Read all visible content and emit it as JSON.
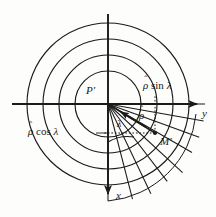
{
  "figure": {
    "type": "polar-coordinate-diagram",
    "background_color": "#fdfdfb",
    "ink_color": "#1a1a1a",
    "origin": {
      "x": 108,
      "y": 104,
      "label": "P'"
    },
    "point_m": {
      "x": 155,
      "y": 133,
      "label": "M'"
    }
  },
  "axes": {
    "y_axis": {
      "label": "y",
      "direction": "right",
      "arrow": true,
      "start_x": 12,
      "end_x": 200,
      "y": 104,
      "label_x": 201,
      "label_y": 113
    },
    "x_axis": {
      "label": "x",
      "direction": "down",
      "arrow": true,
      "x": 108,
      "start_y": 14,
      "end_y": 197,
      "label_x": 115,
      "label_y": 196
    }
  },
  "labels": {
    "origin": {
      "text": "P'",
      "x": 86,
      "y": 91
    },
    "point_m": {
      "text": "M'",
      "x": 160,
      "y": 142
    },
    "rho_sin_lambda": {
      "var": "ρ",
      "hat": "ˆ",
      "rest": " sin ",
      "angle": "λ",
      "x": 143,
      "y": 86
    },
    "rho_cos_lambda": {
      "var": "ρ",
      "hat": "ˆ",
      "rest": " cos ",
      "angle": "λ",
      "x": 55,
      "y": 128
    },
    "rho": {
      "var": "ρ",
      "hat": "ˆ",
      "x": 140,
      "y": 113
    },
    "lambda": {
      "text": "λ",
      "x": 117,
      "y": 123
    }
  },
  "grid": {
    "circle_count": 4,
    "circle_radii": [
      33,
      49,
      65,
      81
    ],
    "radial_line_count": 9,
    "radial_angle_start_deg": 0,
    "radial_angle_end_deg": 90,
    "quadrant_with_grid": "lower-right",
    "dotted_guides": [
      {
        "from": "M'",
        "to": "y-axis vertical drop"
      },
      {
        "from": "M'",
        "to": "x-axis horizontal"
      }
    ]
  },
  "vector": {
    "from": "P'",
    "to": "M'",
    "arrow_head": true,
    "angle_arc_radius": 22,
    "note": "arrow from origin toward M' drawn with arrowhead near mid-length"
  }
}
